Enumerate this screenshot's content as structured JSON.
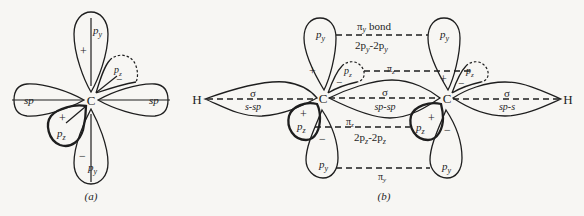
{
  "figure": {
    "panel_a": {
      "caption": "(a)",
      "center_atom": "C",
      "labels": {
        "py_top": "p",
        "py_top_sub": "y",
        "py_bottom": "p",
        "py_bottom_sub": "y",
        "pz_upper": "p",
        "pz_upper_sub": "z",
        "pz_lower": "p",
        "pz_lower_sub": "z",
        "sp_left": "sp",
        "sp_right": "sp",
        "sign_py_top": "+",
        "sign_py_bottom": "−",
        "sign_pz_upper": "−",
        "sign_pz_lower": "+"
      }
    },
    "panel_b": {
      "caption": "(b)",
      "atoms": {
        "h_left": "H",
        "c_left": "C",
        "c_right": "C",
        "h_right": "H"
      },
      "orbital_labels": {
        "py": "p",
        "py_sub": "y",
        "pz": "p",
        "pz_sub": "z",
        "plus": "+",
        "minus": "−"
      },
      "bonds": {
        "pi_y_bond_top": "π",
        "pi_y_bond_top_sub": "y",
        "pi_y_bond_top_word": " bond",
        "pi_y_bond_top_desc": "2p",
        "pi_y_bond_top_desc_sub1": "y",
        "pi_y_bond_top_desc_mid": "-2p",
        "pi_y_bond_top_desc_sub2": "y",
        "pi_z_top": "π",
        "pi_z_top_sub": "z",
        "sigma_left": "σ",
        "sigma_left_desc": "s-sp",
        "sigma_mid": "σ",
        "sigma_mid_desc": "sp-sp",
        "sigma_right": "σ",
        "sigma_right_desc": "sp-s",
        "pi_z_bottom": "π",
        "pi_z_bottom_sub": "z",
        "pi_z_bottom_desc": "2p",
        "pi_z_bottom_desc_sub1": "z",
        "pi_z_bottom_desc_mid": "-2p",
        "pi_z_bottom_desc_sub2": "z",
        "pi_y_bottom": "π",
        "pi_y_bottom_sub": "y"
      }
    }
  }
}
